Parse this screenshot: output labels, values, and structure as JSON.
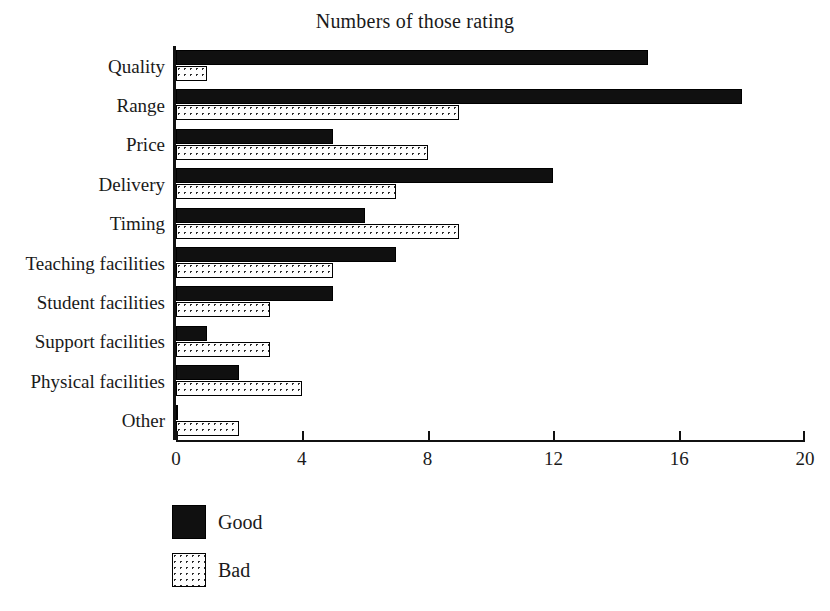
{
  "chart_data": {
    "type": "bar",
    "orientation": "horizontal",
    "title": "Numbers of those rating",
    "xlabel": "",
    "ylabel": "",
    "xlim": [
      0,
      20
    ],
    "xticks": [
      0,
      4,
      8,
      12,
      16,
      20
    ],
    "xtick_labels": [
      "0",
      "4",
      "8",
      "12",
      "16",
      "20"
    ],
    "grid": false,
    "legend_position": "below-left",
    "categories": [
      "Quality",
      "Range",
      "Price",
      "Delivery",
      "Timing",
      "Teaching facilities",
      "Student facilities",
      "Support facilities",
      "Physical facilities",
      "Other"
    ],
    "series": [
      {
        "name": "Good",
        "color": "#101010",
        "fill": "solid-black",
        "values": [
          15,
          18,
          5,
          12,
          6,
          7,
          5,
          1,
          2,
          0
        ]
      },
      {
        "name": "Bad",
        "color": "#fdfdfd",
        "fill": "dotted-stipple",
        "values": [
          1,
          9,
          8,
          7,
          9,
          5,
          3,
          3,
          4,
          2
        ]
      }
    ]
  },
  "legend": {
    "items": [
      {
        "label": "Good",
        "swatch": "solid-black"
      },
      {
        "label": "Bad",
        "swatch": "dotted-stipple"
      }
    ]
  }
}
